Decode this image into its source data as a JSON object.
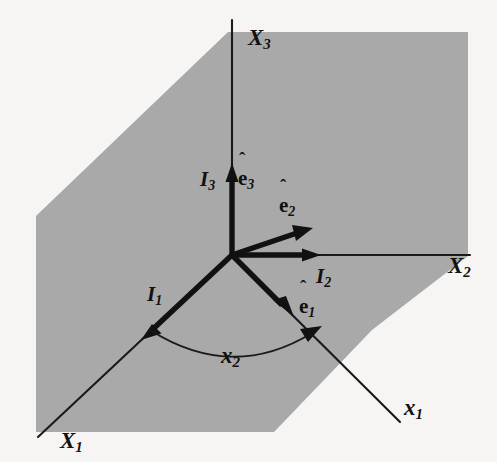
{
  "figure": {
    "background_color": "#f6f5f3",
    "plane_color": "#a9a9a9",
    "ink_color": "#111111"
  },
  "axes": [
    {
      "id": "X3",
      "name": "X",
      "subscript": "3",
      "label": "X₃",
      "direction": "up",
      "style": "thin"
    },
    {
      "id": "X2",
      "name": "X",
      "subscript": "2",
      "label": "X₂",
      "direction": "right",
      "style": "thin"
    },
    {
      "id": "X1",
      "name": "X",
      "subscript": "1",
      "label": "X₁",
      "direction": "down-left",
      "style": "thin"
    },
    {
      "id": "x1",
      "name": "x",
      "subscript": "1",
      "label": "x₁",
      "direction": "down-right",
      "style": "thin"
    }
  ],
  "basis_vectors": [
    {
      "id": "I3",
      "name": "I",
      "subscript": "3",
      "label": "I₃",
      "along": "X3",
      "style": "thick-arrow"
    },
    {
      "id": "I2",
      "name": "I",
      "subscript": "2",
      "label": "I₂",
      "along": "X2",
      "style": "thick-arrow"
    },
    {
      "id": "I1",
      "name": "I",
      "subscript": "1",
      "label": "I₁",
      "along": "X1",
      "style": "thick-arrow"
    },
    {
      "id": "e3",
      "name": "e",
      "subscript": "3",
      "label": "ê₃",
      "accent": "hat",
      "along": "X3",
      "style": "thick-arrow"
    },
    {
      "id": "e2",
      "name": "e",
      "subscript": "2",
      "label": "ê₂",
      "accent": "hat",
      "along": "rotated-2",
      "style": "thick-arrow"
    },
    {
      "id": "e1",
      "name": "e",
      "subscript": "1",
      "label": "ê₁",
      "accent": "hat",
      "along": "x1",
      "style": "thick-arrow"
    }
  ],
  "angle": {
    "id": "x2",
    "name": "x",
    "subscript": "2",
    "label": "x₂",
    "from_axis": "X1",
    "to_axis": "x1",
    "marker": "arc-with-arrowhead"
  },
  "labels": {
    "X3": {
      "base": "X",
      "sub": "3"
    },
    "X2": {
      "base": "X",
      "sub": "2"
    },
    "X1": {
      "base": "X",
      "sub": "1"
    },
    "x1": {
      "base": "x",
      "sub": "1"
    },
    "x2": {
      "base": "x",
      "sub": "2"
    },
    "I3": {
      "base": "I",
      "sub": "3"
    },
    "I2": {
      "base": "I",
      "sub": "2"
    },
    "I1": {
      "base": "I",
      "sub": "1"
    },
    "e3": {
      "base": "e",
      "sub": "3",
      "hat": "ˆ"
    },
    "e2": {
      "base": "e",
      "sub": "2",
      "hat": "ˆ"
    },
    "e1": {
      "base": "e",
      "sub": "1",
      "hat": "ˆ"
    }
  }
}
